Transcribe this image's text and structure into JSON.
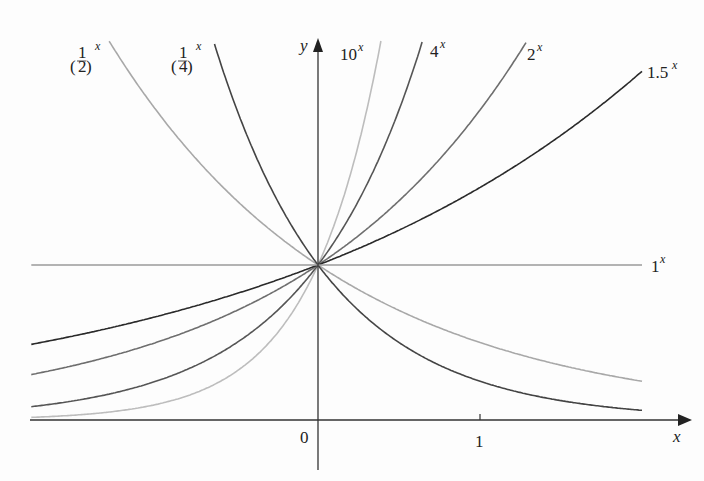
{
  "chart_data": {
    "type": "line",
    "title": "",
    "xlabel": "x",
    "ylabel": "y",
    "x_ticks": [
      {
        "value": 0,
        "label": "0"
      },
      {
        "value": 1,
        "label": "1"
      }
    ],
    "x_range": [
      -1.77,
      2.0
    ],
    "y_range": [
      0,
      2.45
    ],
    "grid": false,
    "legend": "inline labels at curve ends",
    "series": [
      {
        "name": "(1/2)^x",
        "base": 0.5,
        "color": "#a8a8a8",
        "label_base": "(1/2)",
        "label_exp": "x"
      },
      {
        "name": "(1/4)^x",
        "base": 0.25,
        "color": "#444444",
        "label_base": "(1/4)",
        "label_exp": "x"
      },
      {
        "name": "10^x",
        "base": 10,
        "color": "#bdbdbd",
        "label_base": "10",
        "label_exp": "x"
      },
      {
        "name": "4^x",
        "base": 4,
        "color": "#555555",
        "label_base": "4",
        "label_exp": "x"
      },
      {
        "name": "2^x",
        "base": 2,
        "color": "#6e6e6e",
        "label_base": "2",
        "label_exp": "x"
      },
      {
        "name": "1.5^x",
        "base": 1.5,
        "color": "#2a2a2a",
        "label_base": "1.5",
        "label_exp": "x"
      },
      {
        "name": "1^x",
        "base": 1,
        "color": "#9a9a9a",
        "label_base": "1",
        "label_exp": "x"
      }
    ]
  },
  "labels": {
    "half": {
      "num": "1",
      "den": "2",
      "exp": "x"
    },
    "quarter": {
      "num": "1",
      "den": "4",
      "exp": "x"
    },
    "ten": {
      "base": "10",
      "exp": "x"
    },
    "four": {
      "base": "4",
      "exp": "x"
    },
    "two": {
      "base": "2",
      "exp": "x"
    },
    "onefive": {
      "base": "1.5",
      "exp": "x"
    },
    "one": {
      "base": "1",
      "exp": "x"
    },
    "x_axis": "x",
    "y_axis": "y",
    "tick0": "0",
    "tick1": "1"
  }
}
